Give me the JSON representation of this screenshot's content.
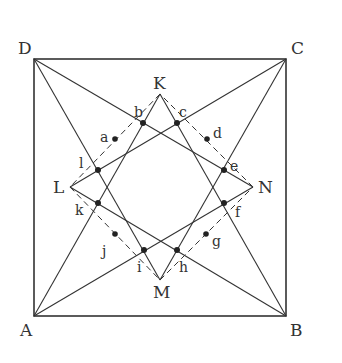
{
  "diagram": {
    "type": "geometry-figure",
    "square": {
      "vertices": {
        "A": {
          "label": "A",
          "x": 34,
          "y": 316
        },
        "B": {
          "label": "B",
          "x": 286,
          "y": 316
        },
        "C": {
          "label": "C",
          "x": 286,
          "y": 59
        },
        "D": {
          "label": "D",
          "x": 34,
          "y": 59
        }
      }
    },
    "star_points": {
      "K": {
        "label": "K",
        "x": 160,
        "y": 94
      },
      "L": {
        "label": "L",
        "x": 70,
        "y": 187
      },
      "M": {
        "label": "M",
        "x": 160,
        "y": 280
      },
      "N": {
        "label": "N",
        "x": 253,
        "y": 187
      }
    },
    "intersection_points": {
      "b": {
        "label": "b",
        "x": 143,
        "y": 123
      },
      "c": {
        "label": "c",
        "x": 177,
        "y": 123
      },
      "e": {
        "label": "e",
        "x": 224,
        "y": 170
      },
      "f": {
        "label": "f",
        "x": 224,
        "y": 203
      },
      "h": {
        "label": "h",
        "x": 177,
        "y": 250
      },
      "i": {
        "label": "i",
        "x": 144,
        "y": 250
      },
      "k": {
        "label": "k",
        "x": 98,
        "y": 203
      },
      "l": {
        "label": "l",
        "x": 98,
        "y": 170
      }
    },
    "midpoints": {
      "a": {
        "label": "a",
        "x": 115,
        "y": 139
      },
      "d": {
        "label": "d",
        "x": 207,
        "y": 139
      },
      "g": {
        "label": "g",
        "x": 206,
        "y": 234
      },
      "j": {
        "label": "j",
        "x": 115,
        "y": 234
      }
    },
    "solid_lines": [
      [
        "D",
        "N"
      ],
      [
        "D",
        "M"
      ],
      [
        "C",
        "L"
      ],
      [
        "C",
        "M"
      ],
      [
        "A",
        "K"
      ],
      [
        "A",
        "N"
      ],
      [
        "B",
        "K"
      ],
      [
        "B",
        "L"
      ]
    ],
    "dashed_lines": [
      [
        "K",
        "L"
      ],
      [
        "L",
        "M"
      ],
      [
        "M",
        "N"
      ],
      [
        "N",
        "K"
      ]
    ],
    "colors": {
      "line": "#333333",
      "background": "#ffffff"
    }
  }
}
